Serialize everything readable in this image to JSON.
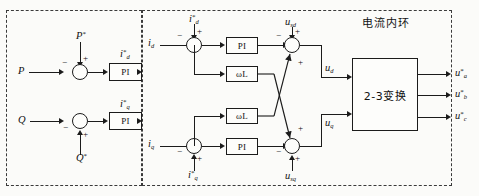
{
  "diagram": {
    "title_cn": "电流内环",
    "regions": [
      {
        "name": "power-outer-loop",
        "label": ""
      },
      {
        "name": "current-inner-loop",
        "label": "电流内环"
      }
    ],
    "blocks": {
      "pi_p": "PI",
      "pi_q": "PI",
      "pi_d": "PI",
      "pi_q_inner": "PI",
      "wl_top": "ωL",
      "wl_bottom": "ωL",
      "transform": "2-3变换"
    },
    "signals": {
      "p_feedback": {
        "base": "P",
        "sup": "",
        "sub": ""
      },
      "p_ref": {
        "base": "P",
        "sup": "*",
        "sub": ""
      },
      "q_feedback": {
        "base": "Q",
        "sup": "",
        "sub": ""
      },
      "q_ref": {
        "base": "Q",
        "sup": "*",
        "sub": ""
      },
      "id_ref_out": {
        "base": "i",
        "sup": "*",
        "sub": "d"
      },
      "iq_ref_out": {
        "base": "i",
        "sup": "*",
        "sub": "q"
      },
      "id_fb": {
        "base": "i",
        "sup": "",
        "sub": "d"
      },
      "iq_fb": {
        "base": "i",
        "sup": "",
        "sub": "q"
      },
      "id_ref_in": {
        "base": "i",
        "sup": "*",
        "sub": "d"
      },
      "iq_ref_in": {
        "base": "i",
        "sup": "*",
        "sub": "q"
      },
      "usd": {
        "base": "u",
        "sup": "",
        "sub": "sd"
      },
      "usq": {
        "base": "u",
        "sup": "",
        "sub": "sq"
      },
      "ud": {
        "base": "u",
        "sup": "",
        "sub": "d"
      },
      "uq": {
        "base": "u",
        "sup": "",
        "sub": "q"
      },
      "ua_ref": {
        "base": "u",
        "sup": "*",
        "sub": "a"
      },
      "ub_ref": {
        "base": "u",
        "sup": "*",
        "sub": "b"
      },
      "uc_ref": {
        "base": "u",
        "sup": "*",
        "sub": "c"
      }
    },
    "signs": {
      "sum_p": {
        "left": "−",
        "top": "+"
      },
      "sum_q": {
        "left": "−",
        "bottom": "+"
      },
      "sum_d": {
        "left": "−",
        "top": "+"
      },
      "sum_q_inner": {
        "left": "−",
        "bottom": "+"
      },
      "sum_ud": {
        "left": "−",
        "top": "+",
        "diag": "+"
      },
      "sum_uq": {
        "left": "−",
        "bottom": "+",
        "diag": "+"
      }
    },
    "colors": {
      "line": "#1b1b1b",
      "dashed": "#3a3a3a",
      "background": "#fbfbf9",
      "block_fill": "#fdfdfb"
    }
  }
}
